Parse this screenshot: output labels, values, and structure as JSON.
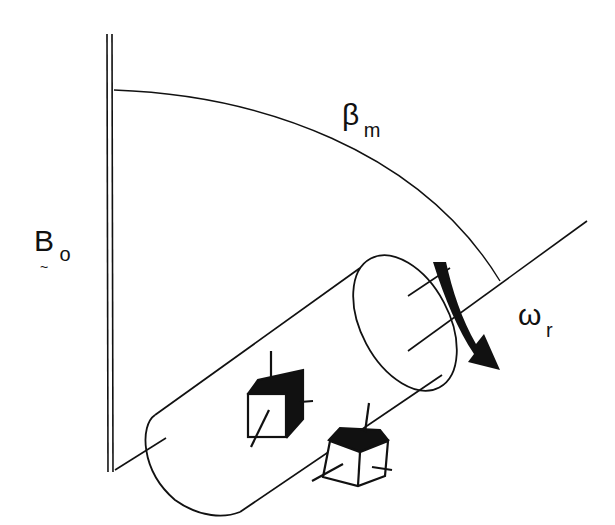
{
  "diagram": {
    "labels": {
      "field": {
        "main": "B",
        "tilde": "~",
        "sub": "o"
      },
      "angle": {
        "main": "β",
        "sub": "m"
      },
      "rotation": {
        "main": "ω",
        "sub": "r"
      }
    },
    "elements": [
      "static-field-axis",
      "angle-arc",
      "rotor-axis",
      "rotor-cylinder",
      "rotation-arrow",
      "crystallite-cube-1",
      "crystallite-cube-2"
    ],
    "colors": {
      "stroke": "#111111",
      "background": "#ffffff"
    }
  }
}
